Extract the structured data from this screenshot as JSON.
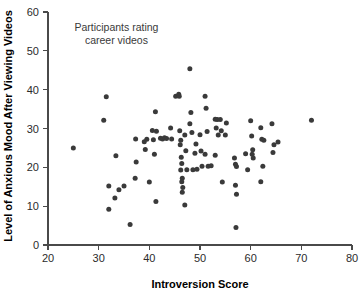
{
  "chart_data": {
    "type": "scatter",
    "title": "",
    "xlabel": "Introversion Score",
    "ylabel": "Level of Anxious Mood After Viewing Videos",
    "xlim": [
      20,
      80
    ],
    "ylim": [
      0,
      60
    ],
    "xticks": [
      20,
      30,
      40,
      50,
      60,
      70,
      80
    ],
    "yticks": [
      0,
      10,
      20,
      30,
      40,
      50,
      60
    ],
    "grid": false,
    "legend": null,
    "annotations": [
      {
        "text_line1": "Participants rating",
        "text_line2": "career videos",
        "x": 33.5,
        "y": 55
      }
    ],
    "marker_color": "#3a3a3a",
    "points": [
      {
        "x": 25.0,
        "y": 25.0
      },
      {
        "x": 31.5,
        "y": 38.2
      },
      {
        "x": 31.0,
        "y": 32.1
      },
      {
        "x": 32.0,
        "y": 15.2
      },
      {
        "x": 32.0,
        "y": 9.2
      },
      {
        "x": 33.4,
        "y": 23.0
      },
      {
        "x": 33.2,
        "y": 12.1
      },
      {
        "x": 34.0,
        "y": 14.2
      },
      {
        "x": 35.0,
        "y": 15.2
      },
      {
        "x": 36.2,
        "y": 5.3
      },
      {
        "x": 37.3,
        "y": 27.3
      },
      {
        "x": 37.4,
        "y": 21.4
      },
      {
        "x": 37.2,
        "y": 17.2
      },
      {
        "x": 39.0,
        "y": 26.6
      },
      {
        "x": 39.2,
        "y": 24.6
      },
      {
        "x": 39.5,
        "y": 27.2
      },
      {
        "x": 40.0,
        "y": 16.2
      },
      {
        "x": 40.6,
        "y": 29.5
      },
      {
        "x": 40.8,
        "y": 27.1
      },
      {
        "x": 41.2,
        "y": 34.3
      },
      {
        "x": 41.4,
        "y": 29.3
      },
      {
        "x": 41.0,
        "y": 23.4
      },
      {
        "x": 41.3,
        "y": 11.2
      },
      {
        "x": 42.2,
        "y": 27.5
      },
      {
        "x": 42.6,
        "y": 27.3
      },
      {
        "x": 43.0,
        "y": 27.6
      },
      {
        "x": 43.4,
        "y": 27.4
      },
      {
        "x": 44.2,
        "y": 30.1
      },
      {
        "x": 44.4,
        "y": 27.3
      },
      {
        "x": 45.2,
        "y": 38.3
      },
      {
        "x": 45.8,
        "y": 38.8
      },
      {
        "x": 45.9,
        "y": 38.3
      },
      {
        "x": 46.0,
        "y": 29.4
      },
      {
        "x": 46.2,
        "y": 27.0
      },
      {
        "x": 46.1,
        "y": 25.8
      },
      {
        "x": 46.3,
        "y": 22.6
      },
      {
        "x": 46.4,
        "y": 21.0
      },
      {
        "x": 46.2,
        "y": 19.3
      },
      {
        "x": 46.5,
        "y": 17.2
      },
      {
        "x": 46.4,
        "y": 16.3
      },
      {
        "x": 46.6,
        "y": 14.8
      },
      {
        "x": 46.5,
        "y": 13.6
      },
      {
        "x": 47.0,
        "y": 28.3
      },
      {
        "x": 47.2,
        "y": 24.3
      },
      {
        "x": 47.4,
        "y": 19.4
      },
      {
        "x": 47.0,
        "y": 10.3
      },
      {
        "x": 48.0,
        "y": 45.4
      },
      {
        "x": 48.2,
        "y": 34.1
      },
      {
        "x": 48.0,
        "y": 31.2
      },
      {
        "x": 48.4,
        "y": 29.0
      },
      {
        "x": 48.6,
        "y": 19.4
      },
      {
        "x": 49.2,
        "y": 26.0
      },
      {
        "x": 49.0,
        "y": 23.6
      },
      {
        "x": 49.4,
        "y": 19.5
      },
      {
        "x": 50.0,
        "y": 28.4
      },
      {
        "x": 50.2,
        "y": 24.2
      },
      {
        "x": 50.4,
        "y": 20.3
      },
      {
        "x": 51.0,
        "y": 38.3
      },
      {
        "x": 51.2,
        "y": 35.2
      },
      {
        "x": 51.4,
        "y": 29.2
      },
      {
        "x": 51.0,
        "y": 23.4
      },
      {
        "x": 51.6,
        "y": 20.3
      },
      {
        "x": 52.2,
        "y": 20.4
      },
      {
        "x": 53.0,
        "y": 32.4
      },
      {
        "x": 53.4,
        "y": 32.3
      },
      {
        "x": 53.2,
        "y": 30.1
      },
      {
        "x": 53.6,
        "y": 28.3
      },
      {
        "x": 53.0,
        "y": 23.1
      },
      {
        "x": 54.0,
        "y": 32.3
      },
      {
        "x": 54.2,
        "y": 29.4
      },
      {
        "x": 54.4,
        "y": 16.2
      },
      {
        "x": 55.2,
        "y": 31.4
      },
      {
        "x": 55.0,
        "y": 28.3
      },
      {
        "x": 56.8,
        "y": 22.4
      },
      {
        "x": 57.0,
        "y": 20.8
      },
      {
        "x": 57.2,
        "y": 20.2
      },
      {
        "x": 57.0,
        "y": 15.4
      },
      {
        "x": 57.2,
        "y": 13.1
      },
      {
        "x": 57.1,
        "y": 4.5
      },
      {
        "x": 59.0,
        "y": 23.5
      },
      {
        "x": 59.4,
        "y": 19.4
      },
      {
        "x": 60.0,
        "y": 32.0
      },
      {
        "x": 60.2,
        "y": 28.1
      },
      {
        "x": 60.4,
        "y": 24.5
      },
      {
        "x": 60.3,
        "y": 23.4
      },
      {
        "x": 60.5,
        "y": 22.4
      },
      {
        "x": 62.0,
        "y": 30.2
      },
      {
        "x": 62.2,
        "y": 27.2
      },
      {
        "x": 62.6,
        "y": 27.0
      },
      {
        "x": 62.4,
        "y": 20.3
      },
      {
        "x": 62.0,
        "y": 16.3
      },
      {
        "x": 64.2,
        "y": 31.2
      },
      {
        "x": 64.6,
        "y": 25.8
      },
      {
        "x": 64.4,
        "y": 23.8
      },
      {
        "x": 65.4,
        "y": 26.5
      },
      {
        "x": 72.0,
        "y": 32.1
      }
    ]
  }
}
